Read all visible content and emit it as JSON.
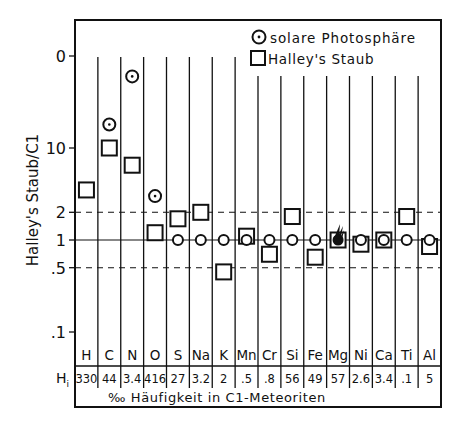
{
  "chart_data": {
    "type": "scatter",
    "title": "",
    "ylabel": "Halley's Staub/C1",
    "xlabel": "‰ Häufigkeit in C1-Meteoriten",
    "yscale": "log",
    "ylim": [
      0.04,
      300
    ],
    "y_ticks": [
      {
        "value": 100,
        "label": "0"
      },
      {
        "value": 10,
        "label": "10"
      },
      {
        "value": 2,
        "label": "2"
      },
      {
        "value": 1,
        "label": "1"
      },
      {
        "value": 0.5,
        "label": ".5"
      },
      {
        "value": 0.1,
        "label": ".1"
      }
    ],
    "reference_lines": [
      {
        "value": 2,
        "style": "dashed"
      },
      {
        "value": 1,
        "style": "solid"
      },
      {
        "value": 0.5,
        "style": "dashed"
      }
    ],
    "categories": [
      "H",
      "C",
      "N",
      "O",
      "S",
      "Na",
      "K",
      "Mn",
      "Cr",
      "Si",
      "Fe",
      "Mg",
      "Ni",
      "Ca",
      "Ti",
      "Al"
    ],
    "abundance_row_label": "H",
    "abundance_row_subscript": "i",
    "abundances": [
      "330",
      "44",
      "3.4",
      "416",
      "27",
      "3.2",
      "2",
      ".5",
      ".8",
      "56",
      "49",
      "57",
      "2.6",
      "3.4",
      ".1",
      "5"
    ],
    "series": [
      {
        "name": "solare Photosphäre",
        "marker": "circle-dot",
        "values": [
          null,
          18,
          60,
          3,
          1,
          1,
          1,
          1,
          1,
          1,
          1,
          1,
          1,
          1,
          1,
          1
        ]
      },
      {
        "name": "Halley's Staub",
        "marker": "square",
        "values": [
          3.5,
          10,
          6.5,
          1.2,
          1.7,
          2,
          0.45,
          1.1,
          0.7,
          1.8,
          0.65,
          1,
          0.9,
          1,
          1.8,
          0.85
        ]
      }
    ],
    "mg_reference_marker": "comet-icon",
    "legend": [
      {
        "marker": "circle-dot",
        "label": "solare Photosphäre"
      },
      {
        "marker": "square",
        "label": "Halley's Staub"
      }
    ],
    "legend_position": "top-right",
    "grid": false
  }
}
